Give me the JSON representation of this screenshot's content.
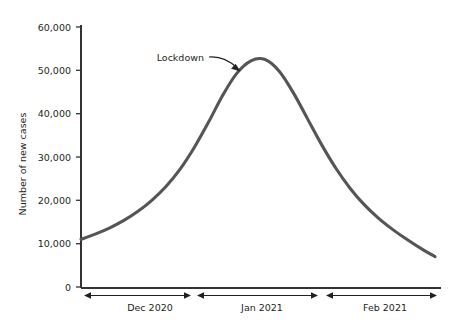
{
  "chart_data": {
    "type": "line",
    "title": "",
    "subtitle": "",
    "xlabel": "",
    "ylabel": "Number of new cases",
    "ylim": [
      0,
      60000
    ],
    "grid": false,
    "legend": false,
    "y_ticks": [
      {
        "value": 0,
        "label": "0"
      },
      {
        "value": 10000,
        "label": "10,000"
      },
      {
        "value": 20000,
        "label": "20,000"
      },
      {
        "value": 30000,
        "label": "30,000"
      },
      {
        "value": 40000,
        "label": "40,000"
      },
      {
        "value": 50000,
        "label": "50,000"
      },
      {
        "value": 60000,
        "label": "60,000"
      }
    ],
    "x_spans": [
      {
        "label": "Dec 2020",
        "start": 0.0,
        "end": 0.31
      },
      {
        "label": "Jan 2021",
        "start": 0.31,
        "end": 0.69
      },
      {
        "label": "Feb 2021",
        "start": 0.69,
        "end": 1.0
      }
    ],
    "series": [
      {
        "name": "New cases",
        "color": "#555555",
        "x": [
          0.0,
          0.04,
          0.08,
          0.12,
          0.16,
          0.2,
          0.24,
          0.28,
          0.32,
          0.36,
          0.4,
          0.44,
          0.48,
          0.52,
          0.56,
          0.6,
          0.64,
          0.68,
          0.72,
          0.76,
          0.8,
          0.84,
          0.88,
          0.92,
          0.96,
          1.0
        ],
        "values": [
          11000,
          12200,
          13600,
          15300,
          17400,
          20000,
          23200,
          27200,
          32200,
          38000,
          44200,
          49300,
          52200,
          52500,
          49800,
          44800,
          38800,
          32800,
          27400,
          22800,
          19000,
          15900,
          13300,
          11000,
          8900,
          7000
        ]
      }
    ],
    "annotations": [
      {
        "label": "Lockdown",
        "points_to": {
          "x": 0.44,
          "y": 49300
        }
      }
    ],
    "axis_color": "#333333",
    "curve_color": "#555555",
    "accent": "#555555"
  }
}
